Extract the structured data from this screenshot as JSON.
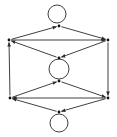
{
  "diagram": {
    "type": "directed-graph",
    "node_color": "#111111",
    "edge_color": "#2a2a2a",
    "nodes": [
      {
        "id": "top",
        "x": 59,
        "y": 26
      },
      {
        "id": "left-upper",
        "x": 9,
        "y": 40
      },
      {
        "id": "right-upper",
        "x": 108,
        "y": 40
      },
      {
        "id": "center-upper",
        "x": 59,
        "y": 58
      },
      {
        "id": "center-lower",
        "x": 59,
        "y": 81
      },
      {
        "id": "left-lower",
        "x": 10,
        "y": 98
      },
      {
        "id": "right-lower",
        "x": 108,
        "y": 98
      },
      {
        "id": "bottom",
        "x": 59,
        "y": 112
      }
    ],
    "edges": [
      {
        "from": "left-upper",
        "to": "top"
      },
      {
        "from": "top",
        "to": "right-upper"
      },
      {
        "from": "left-upper",
        "to": "right-upper"
      },
      {
        "from": "center-upper",
        "to": "left-upper"
      },
      {
        "from": "right-upper",
        "to": "center-upper"
      },
      {
        "from": "left-lower",
        "to": "left-upper"
      },
      {
        "from": "right-upper",
        "to": "right-lower"
      },
      {
        "from": "left-lower",
        "to": "center-lower"
      },
      {
        "from": "center-lower",
        "to": "right-lower"
      },
      {
        "from": "right-lower",
        "to": "left-lower"
      },
      {
        "from": "bottom",
        "to": "left-lower"
      },
      {
        "from": "right-lower",
        "to": "bottom"
      }
    ],
    "loops": [
      {
        "node": "top",
        "cx": 57,
        "cy": 14,
        "r": 9
      },
      {
        "node": "center",
        "cx": 59,
        "cy": 69,
        "r": 10
      },
      {
        "node": "bottom",
        "cx": 59,
        "cy": 123,
        "r": 9
      }
    ]
  }
}
